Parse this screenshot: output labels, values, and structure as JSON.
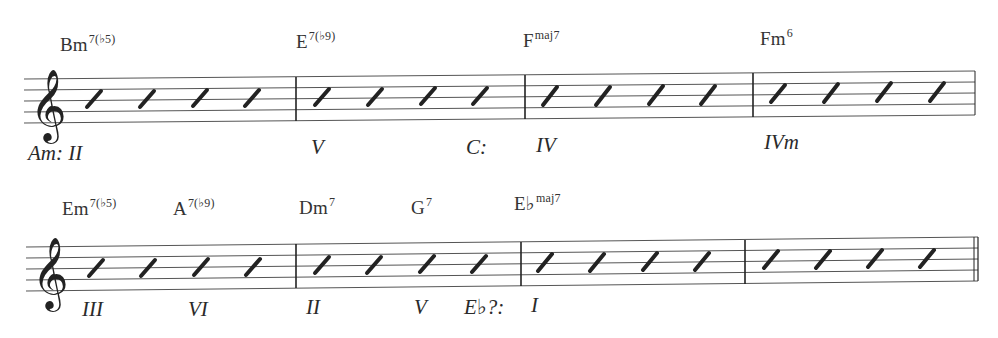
{
  "systems": [
    {
      "chords": [
        {
          "root": "Bm",
          "ext": "7(♭5)",
          "x": 60
        },
        {
          "root": "E",
          "ext": "7(♭9)",
          "x": 296
        },
        {
          "root": "F",
          "ext": "maj7",
          "x": 523
        },
        {
          "root": "Fm",
          "ext": "6",
          "x": 760
        }
      ],
      "analysis": [
        {
          "text": "Am: II",
          "x": 28
        },
        {
          "text": "V",
          "x": 311
        },
        {
          "text": "C:",
          "x": 466
        },
        {
          "text": "IV",
          "x": 536
        },
        {
          "text": "IVm",
          "x": 764
        }
      ],
      "measures": [
        {
          "slashes": 4
        },
        {
          "slashes": 4
        },
        {
          "slashes": 4
        },
        {
          "slashes": 4
        }
      ]
    },
    {
      "chords": [
        {
          "root": "Em",
          "ext": "7(♭5)",
          "x": 62
        },
        {
          "root": "A",
          "ext": "7(♭9)",
          "x": 173
        },
        {
          "root": "Dm",
          "ext": "7",
          "x": 299
        },
        {
          "root": "G",
          "ext": "7",
          "x": 411
        },
        {
          "root": "E♭",
          "ext": "maj7",
          "x": 514
        }
      ],
      "analysis": [
        {
          "text": "III",
          "x": 82
        },
        {
          "text": "VI",
          "x": 188
        },
        {
          "text": "II",
          "x": 306
        },
        {
          "text": "V",
          "x": 414
        },
        {
          "text": "E♭?:",
          "x": 464
        },
        {
          "text": "I",
          "x": 531
        }
      ],
      "measures": [
        {
          "slashes": 4
        },
        {
          "slashes": 4
        },
        {
          "slashes": 4
        },
        {
          "slashes": 4
        }
      ],
      "final_barline": "double"
    }
  ],
  "clef": "treble",
  "notation": "slash"
}
